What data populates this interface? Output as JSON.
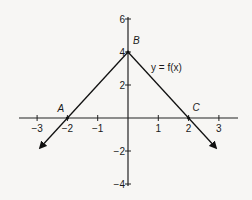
{
  "chart_data": {
    "type": "line",
    "title": "",
    "function_label": "y = f(x)",
    "xlabel": "",
    "ylabel": "",
    "x_ticks": [
      -3,
      -2,
      -1,
      1,
      2,
      3
    ],
    "x_tick_labels": [
      "−3",
      "−2",
      "−1",
      "1",
      "2",
      "3"
    ],
    "y_ticks": [
      6,
      4,
      2,
      -2,
      -4
    ],
    "y_tick_labels": [
      "6",
      "4",
      "2",
      "−2",
      "−4"
    ],
    "xlim": [
      -3.6,
      3.6
    ],
    "ylim": [
      -4.1,
      6.1
    ],
    "grid": false,
    "series": [
      {
        "name": "y = f(x)",
        "x": [
          -2.9,
          -2,
          0,
          2,
          2.9
        ],
        "y": [
          -1.8,
          0,
          4,
          0,
          -1.8
        ]
      }
    ],
    "points": [
      {
        "label": "A",
        "x": -2,
        "y": 0
      },
      {
        "label": "B",
        "x": 0,
        "y": 4
      },
      {
        "label": "C",
        "x": 2,
        "y": 0
      }
    ],
    "arrows_on_ends": true
  }
}
